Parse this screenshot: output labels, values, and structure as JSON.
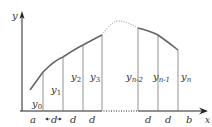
{
  "diagram": {
    "axes": {
      "x_label": "x",
      "y_label": "y"
    },
    "ordinates": [
      {
        "base": "y",
        "sub": "0"
      },
      {
        "base": "y",
        "sub": "1"
      },
      {
        "base": "y",
        "sub": "2"
      },
      {
        "base": "y",
        "sub": "3"
      },
      {
        "base": "y",
        "sub": "n-2"
      },
      {
        "base": "y",
        "sub": "n-1"
      },
      {
        "base": "y",
        "sub": "n"
      }
    ],
    "x_ticks": {
      "a": "a",
      "d1": "d",
      "d2": "d",
      "d3": "d",
      "d4": "d",
      "d5": "d",
      "b": "b"
    },
    "colors": {
      "axis": "#222222",
      "curve": "#666666",
      "verticals": "#777777",
      "dotted": "#888888"
    }
  }
}
